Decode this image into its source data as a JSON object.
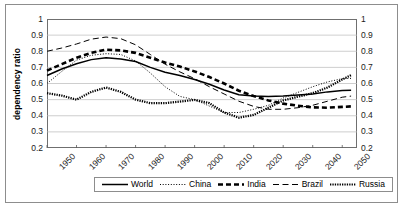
{
  "chart_data": {
    "type": "line",
    "title": "",
    "xlabel": "",
    "ylabel": "dependency ratio",
    "xlim": [
      1950,
      2055
    ],
    "ylim": [
      0.2,
      1.0
    ],
    "grid": true,
    "legend_position": "bottom",
    "x_ticks": [
      "1950",
      "1960",
      "1970",
      "1980",
      "1990",
      "2000",
      "2010",
      "2020",
      "2030",
      "2040",
      "2050"
    ],
    "y_ticks": [
      "0.2",
      "0.3",
      "0.4",
      "0.5",
      "0.6",
      "0.7",
      "0.8",
      "0.9",
      "1"
    ],
    "y_ticks_right": [
      "0.2",
      "0.3",
      "0.4",
      "0.5",
      "0.6",
      "0.7",
      "0.8",
      "0.9",
      "1"
    ],
    "x": [
      1950,
      1955,
      1960,
      1965,
      1970,
      1975,
      1980,
      1985,
      1990,
      1995,
      2000,
      2005,
      2010,
      2015,
      2020,
      2025,
      2030,
      2035,
      2040,
      2045,
      2050,
      2053
    ],
    "series": [
      {
        "name": "World",
        "style": "solid",
        "values": [
          0.65,
          0.69,
          0.722,
          0.748,
          0.76,
          0.752,
          0.736,
          0.7,
          0.67,
          0.65,
          0.625,
          0.595,
          0.56,
          0.53,
          0.522,
          0.52,
          0.522,
          0.528,
          0.535,
          0.548,
          0.556,
          0.558
        ]
      },
      {
        "name": "China",
        "style": "dotted-fine",
        "values": [
          0.6,
          0.675,
          0.745,
          0.775,
          0.785,
          0.78,
          0.74,
          0.665,
          0.58,
          0.52,
          0.5,
          0.46,
          0.42,
          0.42,
          0.44,
          0.465,
          0.51,
          0.545,
          0.58,
          0.61,
          0.63,
          0.632
        ]
      },
      {
        "name": "India",
        "style": "dashed-heavy",
        "values": [
          0.68,
          0.72,
          0.76,
          0.79,
          0.81,
          0.805,
          0.79,
          0.76,
          0.73,
          0.705,
          0.675,
          0.64,
          0.6,
          0.555,
          0.522,
          0.495,
          0.475,
          0.462,
          0.452,
          0.45,
          0.455,
          0.458
        ]
      },
      {
        "name": "Brazil",
        "style": "dashed-long",
        "values": [
          0.8,
          0.82,
          0.845,
          0.875,
          0.888,
          0.878,
          0.84,
          0.78,
          0.72,
          0.672,
          0.63,
          0.58,
          0.535,
          0.49,
          0.458,
          0.44,
          0.44,
          0.45,
          0.465,
          0.49,
          0.515,
          0.522
        ]
      },
      {
        "name": "Russia",
        "style": "dotted-dense",
        "values": [
          0.54,
          0.525,
          0.5,
          0.548,
          0.575,
          0.548,
          0.5,
          0.478,
          0.478,
          0.488,
          0.498,
          0.478,
          0.42,
          0.388,
          0.405,
          0.45,
          0.495,
          0.518,
          0.54,
          0.575,
          0.625,
          0.652
        ]
      }
    ]
  },
  "legend": {
    "items": [
      {
        "label": "World"
      },
      {
        "label": "China"
      },
      {
        "label": "India"
      },
      {
        "label": "Brazil"
      },
      {
        "label": "Russia"
      }
    ]
  }
}
